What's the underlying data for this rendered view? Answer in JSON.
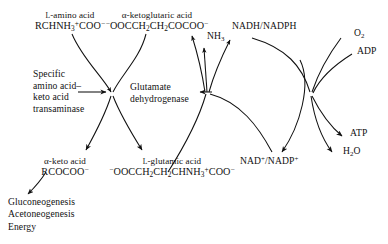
{
  "diagram": {
    "type": "biochemical-pathway",
    "background_color": "#ffffff",
    "stroke_color": "#111111"
  },
  "substrates": {
    "amino_acid": {
      "name_prefix": "L",
      "name": "-amino acid",
      "formula_pre": "RCHNH",
      "formula_sub1": "3",
      "formula_sup1": "+",
      "formula_mid": "COO",
      "formula_sup2": "−"
    },
    "ketoglutaric_acid": {
      "name": "α-ketoglutaric acid",
      "formula_sup_lead": "−",
      "formula_a": "OOCCH",
      "formula_sub_a": "2",
      "formula_b": "CH",
      "formula_sub_b": "2",
      "formula_c": "COCOO",
      "formula_sup_tail": "−"
    },
    "keto_acid": {
      "name": "α-keto acid",
      "formula": "RCOCOO",
      "formula_sup": "−"
    },
    "glutamic_acid": {
      "name_prefix": "L",
      "name": "-glutamic acid",
      "formula_sup_lead": "−",
      "formula_a": "OOCCH",
      "formula_sub_a": "2",
      "formula_b": "CH",
      "formula_sub_b": "2",
      "formula_c": "CHNH",
      "formula_sub_c": "3",
      "formula_sup_c": "+",
      "formula_d": "COO",
      "formula_sup_tail": "−"
    }
  },
  "enzymes": {
    "transaminase": {
      "line1": "Specific",
      "line2": "amino acid–",
      "line3": "keto acid",
      "line4": "transaminase"
    },
    "dehydrogenase": {
      "line1": "Glutamate",
      "line2": "dehydrogenase"
    }
  },
  "cofactors": {
    "ammonia": {
      "text": "NH",
      "sub": "3"
    },
    "nadh_nadph": {
      "text": "NADH/NADPH"
    },
    "nad_nadp": {
      "a": "NAD",
      "sup_a": "+",
      "slash": "/NADP",
      "sup_b": "+"
    },
    "oxygen": {
      "text": "O",
      "sub": "2"
    },
    "adp": {
      "text": "ADP"
    },
    "atp": {
      "text": "ATP"
    },
    "water": {
      "text": "H",
      "sub": "2",
      "tail": "O"
    }
  },
  "fates": {
    "line1": "Gluconeogenesis",
    "line2": "Acetoneogenesis",
    "line3": "Energy"
  }
}
